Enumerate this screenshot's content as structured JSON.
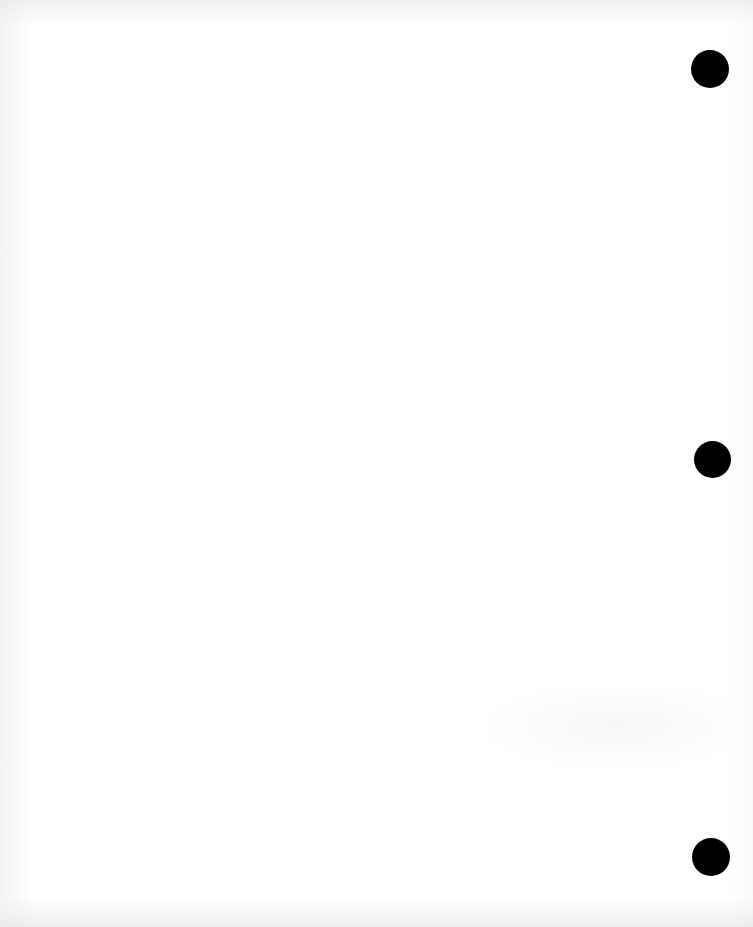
{
  "document": {
    "kind": "scanned-page",
    "page_state": "blank",
    "visible_text": "",
    "width": 753,
    "height": 927
  },
  "colors": {
    "page_background": "#ffffff",
    "punch_hole": "#000000",
    "edge_shadow": "#e4e4e6"
  },
  "punch_holes": {
    "count": 3,
    "pattern": "three-hole-punch",
    "alignment": "right-edge-vertical-column",
    "items": [
      {
        "name": "punch-hole-top",
        "cx": 710,
        "cy": 69,
        "diameter": 38
      },
      {
        "name": "punch-hole-middle",
        "cx": 712,
        "cy": 459,
        "diameter": 37
      },
      {
        "name": "punch-hole-bottom",
        "cx": 711,
        "cy": 857,
        "diameter": 38
      }
    ]
  },
  "artifacts": {
    "top_edge_band": true,
    "left_edge_band": true,
    "bottom_edge_band": true,
    "reverse_side_ghosting": true
  }
}
